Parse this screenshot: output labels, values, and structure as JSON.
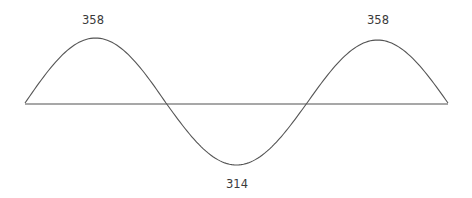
{
  "diagram": {
    "type": "wave",
    "colors": {
      "wave": "#555555",
      "baseline": "#8a8a8a",
      "label": "#3a3a3a",
      "background": "#ffffff"
    },
    "extrema": [
      {
        "kind": "peak",
        "label": "358"
      },
      {
        "kind": "trough",
        "label": "314"
      },
      {
        "kind": "peak",
        "label": "358"
      }
    ]
  }
}
